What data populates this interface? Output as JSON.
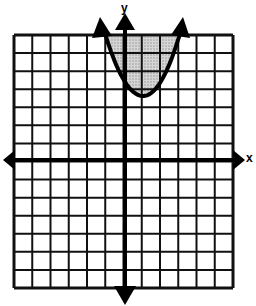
{
  "chart_data": {
    "type": "line",
    "title": "",
    "xlabel": "x",
    "ylabel": "y",
    "xlim": [
      -6,
      6
    ],
    "ylim": [
      -7,
      7
    ],
    "grid": true,
    "grid_columns": 12,
    "grid_rows": 14,
    "axes_arrows": true,
    "series": [
      {
        "name": "parabola",
        "kind": "quadratic-inequality",
        "vertex": [
          1,
          3.5
        ],
        "opens": "up",
        "approx_equation": "y >= 2(x-1)^2 + 3.5",
        "boundary_style": "solid",
        "shaded_region": "inside (above) the parabola",
        "shade_color": "#bdbdbd",
        "end_arrows": true
      }
    ]
  },
  "labels": {
    "x_axis": "x",
    "y_axis": "y"
  },
  "colors": {
    "grid": "#111111",
    "axis": "#000000",
    "shade": "#bdbdbd",
    "background": "#ffffff"
  }
}
